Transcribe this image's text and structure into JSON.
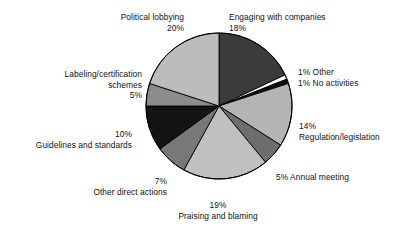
{
  "chart_data": {
    "type": "pie",
    "title": "",
    "subtitle": "",
    "xlabel": "",
    "ylabel": "",
    "legend_position": "none",
    "grid": false,
    "units": "percent",
    "start_angle_deg": 0,
    "direction": "clockwise",
    "categories": [
      "Engaging with companies",
      "Other",
      "No activities",
      "Regulation/legislation",
      "Annual meeting",
      "Praising and blaming",
      "Other direct actions",
      "Guidelines and standards",
      "Labeling/certification schemes",
      "Political lobbying"
    ],
    "values": [
      18,
      1,
      1,
      14,
      5,
      19,
      7,
      10,
      5,
      20
    ],
    "colors": [
      "#3b3b3b",
      "#ffffff",
      "#0d0d0d",
      "#b4b4b4",
      "#6e6e6e",
      "#c0c0c0",
      "#787878",
      "#141414",
      "#8c8c8c",
      "#bcbcbc"
    ],
    "slices": [
      {
        "label": "Engaging with companies",
        "value": 18,
        "value_text": "18%",
        "color": "#3b3b3b"
      },
      {
        "label": "Other",
        "value": 1,
        "value_text": "1%",
        "color": "#ffffff"
      },
      {
        "label": "No activities",
        "value": 1,
        "value_text": "1%",
        "color": "#0d0d0d"
      },
      {
        "label": "Regulation/legislation",
        "value": 14,
        "value_text": "14%",
        "color": "#b4b4b4"
      },
      {
        "label": "Annual meeting",
        "value": 5,
        "value_text": "5%",
        "color": "#6e6e6e"
      },
      {
        "label": "Praising and blaming",
        "value": 19,
        "value_text": "19%",
        "color": "#c0c0c0"
      },
      {
        "label": "Other direct actions",
        "value": 7,
        "value_text": "7%",
        "color": "#787878"
      },
      {
        "label": "Guidelines and standards",
        "value": 10,
        "value_text": "10%",
        "color": "#141414"
      },
      {
        "label": "Labeling/certification schemes",
        "value": 5,
        "value_text": "5%",
        "color": "#8c8c8c"
      },
      {
        "label": "Political lobbying",
        "value": 20,
        "value_text": "20%",
        "color": "#bcbcbc"
      }
    ]
  },
  "labels": {
    "political_lobbying": {
      "name": "Political lobbying",
      "value": "20%"
    },
    "engaging": {
      "name": "Engaging with companies",
      "value": "18%"
    },
    "other": {
      "text": "1% Other"
    },
    "no_activities": {
      "text": "1% No activities"
    },
    "labeling": {
      "name_line1": "Labeling/certification",
      "name_line2": "schemes",
      "value": "5%"
    },
    "regulation": {
      "value": "14%",
      "name": "Regulation/legislation"
    },
    "guidelines": {
      "value": "10%",
      "name": "Guidelines and standards"
    },
    "annual_meeting": {
      "text": "5% Annual meeting"
    },
    "other_direct": {
      "value": "7%",
      "name": "Other direct actions"
    },
    "praising": {
      "value": "19%",
      "name": "Praising and blaming"
    }
  },
  "style": {
    "background": "#ffffff",
    "outline": "#000000",
    "text": "#111111"
  }
}
